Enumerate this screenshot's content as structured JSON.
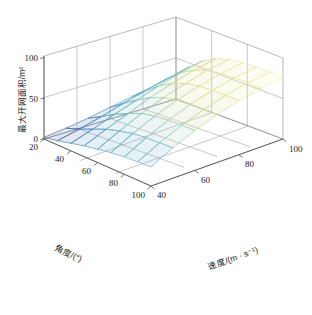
{
  "chart_data": {
    "type": "surface",
    "title": "",
    "xlabel": "角度/(°)",
    "ylabel": "速度/(m · s⁻¹)",
    "zlabel": "最大开网面积/m²",
    "xlim": [
      20,
      100
    ],
    "ylim": [
      40,
      100
    ],
    "zlim": [
      0,
      100
    ],
    "xticks": [
      "20",
      "40",
      "60",
      "80",
      "100"
    ],
    "yticks": [
      "40",
      "60",
      "80",
      "100"
    ],
    "zticks": [
      "0",
      "50",
      "100"
    ],
    "grid": true,
    "legend": "none",
    "colormap": "parula",
    "mesh_style": "wireframe-with-face",
    "x_values": [
      20,
      30,
      40,
      50,
      60,
      70,
      80,
      90,
      100
    ],
    "y_values": [
      40,
      50,
      60,
      70,
      80,
      90,
      100
    ],
    "z_matrix": [
      [
        2,
        5,
        9,
        14,
        19,
        24,
        29
      ],
      [
        5,
        11,
        18,
        26,
        33,
        40,
        46
      ],
      [
        9,
        18,
        28,
        37,
        46,
        54,
        60
      ],
      [
        13,
        25,
        36,
        47,
        56,
        64,
        70
      ],
      [
        16,
        30,
        43,
        54,
        63,
        71,
        76
      ],
      [
        19,
        34,
        47,
        58,
        67,
        74,
        79
      ],
      [
        21,
        36,
        49,
        60,
        69,
        76,
        81
      ],
      [
        22,
        37,
        50,
        61,
        70,
        77,
        82
      ],
      [
        23,
        38,
        51,
        62,
        71,
        77,
        82
      ]
    ],
    "z_note": "rows = 角度 (20..100), cols = 速度 (40..100), values = 最大开网面积/m²",
    "colors": {
      "low": "#3b4ea0",
      "mid_low": "#4a9ec4",
      "mid": "#8fc9c2",
      "mid_high": "#d8d98f",
      "high": "#f3eeb0",
      "axis": "#6e6e6e",
      "text": "#1a1a1a",
      "background": "#ffffff"
    }
  },
  "axes": {
    "z": {
      "label": "最大开网面积/m²",
      "ticks": [
        {
          "value": "100"
        },
        {
          "value": "50"
        },
        {
          "value": "0"
        }
      ]
    },
    "x": {
      "label": "角度/(°)",
      "ticks": [
        {
          "value": "20"
        },
        {
          "value": "40"
        },
        {
          "value": "60"
        },
        {
          "value": "80"
        },
        {
          "value": "100"
        }
      ]
    },
    "y": {
      "label": "速度/(m · s⁻¹)",
      "ticks": [
        {
          "value": "40"
        },
        {
          "value": "60"
        },
        {
          "value": "80"
        },
        {
          "value": "100"
        }
      ]
    }
  }
}
